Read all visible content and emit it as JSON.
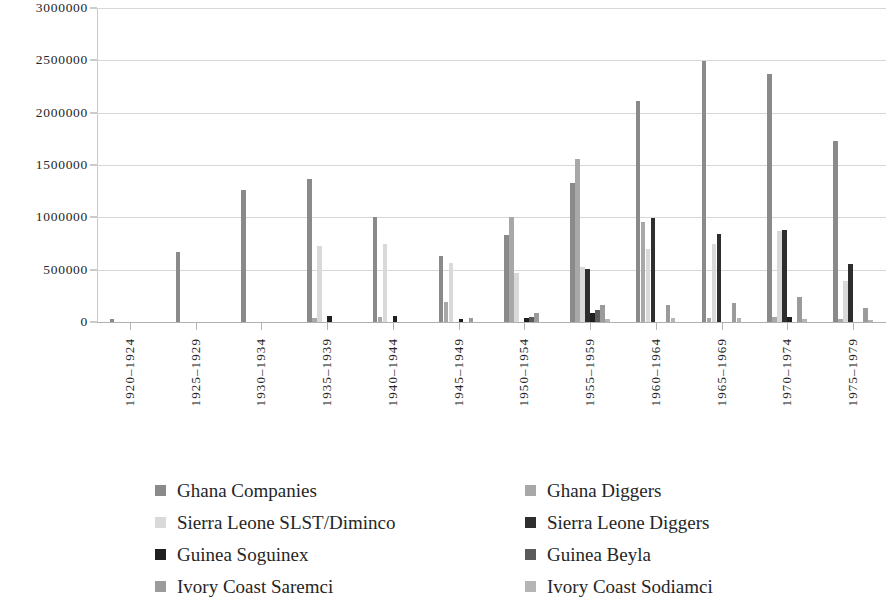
{
  "chart_data": {
    "type": "bar",
    "title": "",
    "subtitle": "",
    "xlabel": "",
    "ylabel": "",
    "ylim": [
      0,
      3000000
    ],
    "grid": true,
    "legend_position": "bottom",
    "y_ticks": [
      "0",
      "500000",
      "1000000",
      "1500000",
      "2000000",
      "2500000",
      "3000000"
    ],
    "y_tick_values": [
      0,
      500000,
      1000000,
      1500000,
      2000000,
      2500000,
      3000000
    ],
    "categories": [
      "1920–1924",
      "1925–1929",
      "1930–1934",
      "1935–1939",
      "1940–1944",
      "1945–1949",
      "1950–1954",
      "1955–1959",
      "1960–1964",
      "1965–1969",
      "1970–1974",
      "1975–1979"
    ],
    "series": [
      {
        "name": "Ghana Companies",
        "color": "#8a8a8a",
        "values": [
          25000,
          670000,
          1260000,
          1370000,
          1000000,
          630000,
          830000,
          1325000,
          2115000,
          2495000,
          2370000,
          1725000
        ]
      },
      {
        "name": "Ghana Diggers",
        "color": "#a8a8a8",
        "values": [
          0,
          0,
          0,
          40000,
          50000,
          190000,
          1000000,
          1555000,
          960000,
          35000,
          50000,
          30000
        ]
      },
      {
        "name": "Sierra Leone SLST/Diminco",
        "color": "#d9d9d9",
        "values": [
          0,
          0,
          0,
          725000,
          745000,
          560000,
          465000,
          530000,
          700000,
          745000,
          865000,
          390000
        ]
      },
      {
        "name": "Sierra Leone Diggers",
        "color": "#2e2e2e",
        "values": [
          0,
          0,
          0,
          0,
          0,
          0,
          0,
          510000,
          995000,
          845000,
          875000,
          555000
        ]
      },
      {
        "name": "Guinea Soguinex",
        "color": "#1f1f1f",
        "values": [
          0,
          0,
          0,
          55000,
          55000,
          30000,
          35000,
          85000,
          0,
          0,
          45000,
          0
        ]
      },
      {
        "name": "Guinea Beyla",
        "color": "#5a5a5a",
        "values": [
          0,
          0,
          0,
          0,
          0,
          0,
          45000,
          115000,
          0,
          0,
          0,
          0
        ]
      },
      {
        "name": "Ivory Coast Saremci",
        "color": "#9b9b9b",
        "values": [
          0,
          0,
          0,
          0,
          0,
          40000,
          90000,
          160000,
          165000,
          180000,
          235000,
          130000
        ]
      },
      {
        "name": "Ivory Coast Sodiamci",
        "color": "#b5b5b5",
        "values": [
          0,
          0,
          0,
          0,
          0,
          0,
          0,
          30000,
          40000,
          40000,
          25000,
          20000
        ]
      }
    ]
  },
  "legend": {
    "rows": [
      [
        {
          "label": "Ghana Companies",
          "color": "#8a8a8a",
          "icon": "legend-swatch"
        },
        {
          "label": "Ghana Diggers",
          "color": "#a8a8a8",
          "icon": "legend-swatch"
        }
      ],
      [
        {
          "label": "Sierra Leone SLST/Diminco",
          "color": "#d9d9d9",
          "icon": "legend-swatch"
        },
        {
          "label": "Sierra Leone Diggers",
          "color": "#2e2e2e",
          "icon": "legend-swatch"
        }
      ],
      [
        {
          "label": "Guinea Soguinex",
          "color": "#1f1f1f",
          "icon": "legend-swatch"
        },
        {
          "label": "Guinea Beyla",
          "color": "#5a5a5a",
          "icon": "legend-swatch"
        }
      ],
      [
        {
          "label": "Ivory Coast Saremci",
          "color": "#9b9b9b",
          "icon": "legend-swatch"
        },
        {
          "label": "Ivory Coast Sodiamci",
          "color": "#b5b5b5",
          "icon": "legend-swatch"
        }
      ]
    ]
  },
  "style": {
    "gridline_color": "#d7d7d7",
    "axis_color": "#b0b0b0",
    "text_color": "#262626",
    "background": "#ffffff"
  }
}
